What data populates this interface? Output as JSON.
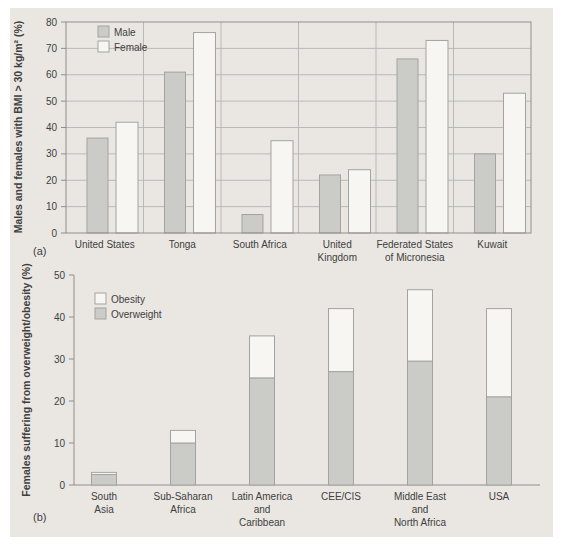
{
  "figure": {
    "label_a": "(a)",
    "label_b": "(b)"
  },
  "colors": {
    "panel_bg": "#eae7e3",
    "bar_gray": "#cbcbc7",
    "bar_white": "#f7f6f3",
    "bar_border": "#a3a3a0",
    "grid": "#b9b9b5",
    "axis": "#8f8f8c",
    "text": "#404040"
  },
  "chart_data": [
    {
      "id": "a",
      "type": "bar",
      "title": "",
      "ylabel": "Males and females with BMI > 30 kg/m² (%)",
      "xlabel": "",
      "ylim": [
        0,
        80
      ],
      "yticks": [
        0,
        10,
        20,
        30,
        40,
        50,
        60,
        70,
        80
      ],
      "grid": true,
      "box": true,
      "category_dividers": true,
      "legend_position": "top-left",
      "legend": [
        {
          "label": "Male",
          "swatch": "gray"
        },
        {
          "label": "Female",
          "swatch": "white"
        }
      ],
      "categories": [
        "United States",
        "Tonga",
        "South Africa",
        "United Kingdom",
        "Federated States of Micronesia",
        "Kuwait"
      ],
      "category_lines": [
        [
          "United States"
        ],
        [
          "Tonga"
        ],
        [
          "South Africa"
        ],
        [
          "United",
          "Kingdom"
        ],
        [
          "Federated States",
          "of Micronesia"
        ],
        [
          "Kuwait"
        ]
      ],
      "series": [
        {
          "name": "Male",
          "swatch": "gray",
          "values": [
            36,
            61,
            7,
            22,
            66,
            30
          ]
        },
        {
          "name": "Female",
          "swatch": "white",
          "values": [
            42,
            76,
            35,
            24,
            73,
            53
          ]
        }
      ]
    },
    {
      "id": "b",
      "type": "stacked-bar",
      "title": "",
      "ylabel": "Females suffering from overweight/obesity (%)",
      "xlabel": "",
      "ylim": [
        0,
        50
      ],
      "yticks": [
        0,
        10,
        20,
        30,
        40,
        50
      ],
      "grid": false,
      "box": false,
      "legend_position": "top-left",
      "legend": [
        {
          "label": "Obesity",
          "swatch": "white"
        },
        {
          "label": "Overweight",
          "swatch": "gray"
        }
      ],
      "categories": [
        "South Asia",
        "Sub-Saharan Africa",
        "Latin America and Caribbean",
        "CEE/CIS",
        "Middle East and North Africa",
        "USA"
      ],
      "category_lines": [
        [
          "South",
          "Asia"
        ],
        [
          "Sub-Saharan",
          "Africa"
        ],
        [
          "Latin America",
          "and",
          "Caribbean"
        ],
        [
          "CEE/CIS"
        ],
        [
          "Middle East",
          "and",
          "North Africa"
        ],
        [
          "USA"
        ]
      ],
      "series": [
        {
          "name": "Overweight",
          "swatch": "gray",
          "values": [
            2.5,
            10,
            25.5,
            27,
            29.5,
            21
          ]
        },
        {
          "name": "Obesity",
          "swatch": "white",
          "values": [
            0.5,
            3,
            10,
            15,
            17,
            21
          ]
        }
      ],
      "totals": [
        3,
        13,
        35.5,
        42,
        46.5,
        42
      ]
    }
  ]
}
